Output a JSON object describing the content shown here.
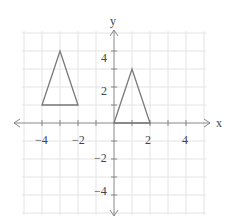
{
  "chart_data": {
    "type": "coordinate-plane",
    "title": "",
    "xlabel": "x",
    "ylabel": "y",
    "xlim": [
      -5,
      5
    ],
    "ylim": [
      -5,
      5
    ],
    "grid": true,
    "grid_step": 1,
    "x_tick_labels": [
      "-4",
      "-2",
      "2",
      "4"
    ],
    "y_tick_labels": [
      "4",
      "2",
      "-2",
      "-4"
    ],
    "shapes": [
      {
        "name": "left-triangle",
        "type": "triangle",
        "vertices": [
          [
            -4,
            1
          ],
          [
            -2,
            1
          ],
          [
            -3,
            4
          ]
        ]
      },
      {
        "name": "right-triangle",
        "type": "triangle",
        "vertices": [
          [
            0,
            0
          ],
          [
            2,
            0
          ],
          [
            1,
            3
          ]
        ]
      }
    ]
  },
  "labels": {
    "x_axis": "x",
    "y_axis": "y",
    "x_ticks": [
      "−4",
      "−2",
      "2",
      "4"
    ],
    "y_ticks": [
      "4",
      "2",
      "−2",
      "−4"
    ]
  }
}
